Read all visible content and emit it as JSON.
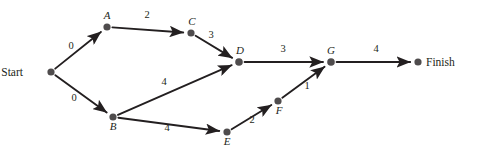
{
  "diagram": {
    "type": "directed-activity-network",
    "background_color": "#ffffff",
    "node_color": "#4f4c4d",
    "edge_color": "#231f20",
    "text_color": "#231f20",
    "nodes": [
      {
        "id": "Start",
        "label": "Start",
        "x": 51,
        "y": 72,
        "label_style": "roman",
        "label_dx": -28,
        "label_dy": 4,
        "radius": 3.6
      },
      {
        "id": "A",
        "label": "A",
        "x": 107,
        "y": 27,
        "label_style": "italic",
        "label_dx": 0,
        "label_dy": -8,
        "radius": 3.6
      },
      {
        "id": "C",
        "label": "C",
        "x": 191,
        "y": 33,
        "label_style": "italic",
        "label_dx": 1,
        "label_dy": -8,
        "radius": 3.6
      },
      {
        "id": "B",
        "label": "B",
        "x": 113,
        "y": 117,
        "label_style": "italic",
        "label_dx": 0,
        "label_dy": 13,
        "radius": 3.6
      },
      {
        "id": "D",
        "label": "D",
        "x": 239,
        "y": 62,
        "label_style": "italic",
        "label_dx": 1,
        "label_dy": -8,
        "radius": 3.8
      },
      {
        "id": "E",
        "label": "E",
        "x": 227,
        "y": 132,
        "label_style": "italic",
        "label_dx": 0,
        "label_dy": 13,
        "radius": 3.6
      },
      {
        "id": "F",
        "label": "F",
        "x": 278,
        "y": 101,
        "label_style": "italic",
        "label_dx": 1,
        "label_dy": 13,
        "radius": 3.6
      },
      {
        "id": "G",
        "label": "G",
        "x": 331,
        "y": 62,
        "label_style": "italic",
        "label_dx": 0,
        "label_dy": -8,
        "radius": 3.8
      },
      {
        "id": "Finish",
        "label": "Finish",
        "x": 418,
        "y": 62,
        "label_style": "roman",
        "label_dx": 8,
        "label_dy": 4,
        "radius": 3.6
      }
    ],
    "edges": [
      {
        "from": "Start",
        "to": "A",
        "weight": "0",
        "label_x": 71,
        "label_y": 49
      },
      {
        "from": "Start",
        "to": "B",
        "weight": "0",
        "label_x": 74,
        "label_y": 101
      },
      {
        "from": "A",
        "to": "C",
        "weight": "2",
        "label_x": 147,
        "label_y": 18
      },
      {
        "from": "C",
        "to": "D",
        "weight": "3",
        "label_x": 211,
        "label_y": 38
      },
      {
        "from": "B",
        "to": "D",
        "weight": "4",
        "label_x": 164,
        "label_y": 85
      },
      {
        "from": "B",
        "to": "E",
        "weight": "4",
        "label_x": 167,
        "label_y": 131
      },
      {
        "from": "E",
        "to": "F",
        "weight": "2",
        "label_x": 252,
        "label_y": 123
      },
      {
        "from": "F",
        "to": "G",
        "weight": "1",
        "label_x": 307,
        "label_y": 89
      },
      {
        "from": "D",
        "to": "G",
        "weight": "3",
        "label_x": 283,
        "label_y": 52
      },
      {
        "from": "G",
        "to": "Finish",
        "weight": "4",
        "label_x": 376,
        "label_y": 52
      }
    ]
  }
}
